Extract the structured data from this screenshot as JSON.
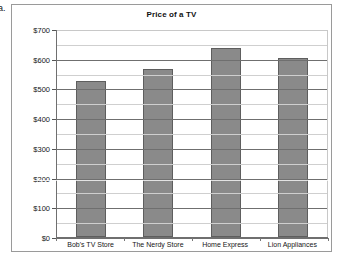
{
  "question_label": "a.",
  "chart_data": {
    "type": "bar",
    "title": "Price of a TV",
    "xlabel": "",
    "ylabel": "",
    "categories": [
      "Bob's TV Store",
      "The Nerdy Store",
      "Home Express",
      "Lion Appliances"
    ],
    "values": [
      527,
      568,
      638,
      605
    ],
    "ylim": [
      0,
      700
    ],
    "y_major_ticks": [
      0,
      100,
      200,
      300,
      400,
      500,
      600,
      700
    ],
    "y_tick_labels": [
      "$0",
      "$100",
      "$200",
      "$300",
      "$400",
      "$500",
      "$600",
      "$700"
    ],
    "y_minor_ticks": [
      50,
      150,
      250,
      350,
      450,
      550,
      650
    ],
    "grid": true,
    "legend": false,
    "bar_color": "#8a8a8a",
    "bar_border_color": "#5e5e5e",
    "major_gridline_color": "#6f6f6f",
    "minor_gridline_color": "#cfcfcf",
    "plot_background": "#ffffff"
  }
}
